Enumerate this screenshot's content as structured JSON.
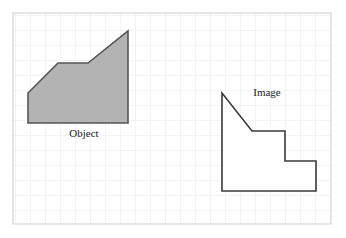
{
  "figure": {
    "title": "",
    "background_color": "#ffffff",
    "frame": {
      "name": "grid-frame",
      "x": 13,
      "y": 13,
      "width": 318,
      "height": 211,
      "border_color": "#d8d8d8",
      "border_width": 1
    },
    "grid": {
      "cell_size": 15,
      "line_color": "#e6e6e6",
      "line_width": 1,
      "visible": true,
      "columns": 21,
      "rows": 14
    },
    "shapes": [
      {
        "id": "object-shape",
        "label": "Object",
        "fill": "#b3b3b3",
        "stroke": "#555555",
        "stroke_width": 1.6,
        "points": "28,93 28,123 128,123 128,31 88,63 58,63",
        "label_position": {
          "x": 84,
          "y": 137
        }
      },
      {
        "id": "image-shape",
        "label": "Image",
        "fill": "#ffffff",
        "stroke": "#3a3a3a",
        "stroke_width": 1.6,
        "points": "222,93 222,191 316,191 316,161 285,161 285,131 252,131",
        "label_position": {
          "x": 267,
          "y": 96
        }
      }
    ],
    "labels": {
      "object": "Object",
      "image": "Image"
    }
  }
}
